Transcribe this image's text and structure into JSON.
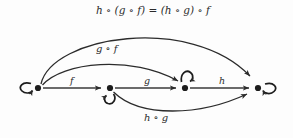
{
  "diagram": {
    "kind": "category-theory-composition-diagram",
    "background_color": "#fdfdfd",
    "stroke_color": "#2b2b2b",
    "nodes": [
      {
        "id": "A",
        "name": "object-a",
        "x": 38,
        "y": 88,
        "loop": "left",
        "loop_label": "identity-A"
      },
      {
        "id": "B",
        "name": "object-b",
        "x": 110,
        "y": 88,
        "loop": "below",
        "loop_label": "identity-B"
      },
      {
        "id": "C",
        "name": "object-c",
        "x": 185,
        "y": 88,
        "loop": "above",
        "loop_label": "identity-C"
      },
      {
        "id": "D",
        "name": "object-d",
        "x": 258,
        "y": 88,
        "loop": "right",
        "loop_label": "identity-D"
      }
    ],
    "edges": [
      {
        "id": "f",
        "from": "A",
        "to": "B",
        "label": "f",
        "style": "straight",
        "label_x": 73,
        "label_y": 82
      },
      {
        "id": "g",
        "from": "B",
        "to": "C",
        "label": "g",
        "style": "straight",
        "label_x": 147,
        "label_y": 82
      },
      {
        "id": "h",
        "from": "C",
        "to": "D",
        "label": "h",
        "style": "straight",
        "label_x": 221,
        "label_y": 82
      },
      {
        "id": "gf",
        "from": "A",
        "to": "C",
        "label": "g ∘ f",
        "style": "arc-above",
        "label_x": 96,
        "label_y": 47
      },
      {
        "id": "hg",
        "from": "B",
        "to": "D",
        "label": "h ∘ g",
        "style": "arc-below",
        "label_x": 161,
        "label_y": 117
      },
      {
        "id": "hgf",
        "from": "A",
        "to": "D",
        "label": "h ∘ (g ∘ f) = (h ∘ g) ∘ f",
        "style": "arc-above-outer",
        "label_x": 96,
        "label_y": 8
      }
    ],
    "labels": {
      "f": "f",
      "g": "g",
      "h": "h",
      "g_after_f": "g ∘ f",
      "h_after_g": "h ∘ g",
      "associativity": "h ∘ (g ∘ f) = (h ∘ g) ∘ f"
    }
  }
}
